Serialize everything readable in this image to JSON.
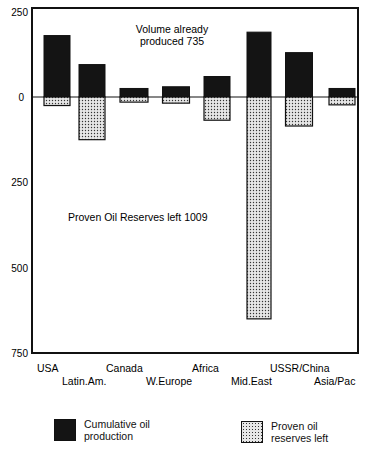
{
  "chart_data": {
    "type": "bar",
    "title": "",
    "xlabel": "",
    "ylabel": "",
    "ylim": [
      -750,
      250
    ],
    "yticks": [
      250,
      0,
      -250,
      -500,
      -750
    ],
    "ytick_labels": [
      "250",
      "0",
      "250",
      "500",
      "750"
    ],
    "categories": [
      "USA",
      "Latin.Am.",
      "Canada",
      "W.Europe",
      "Africa",
      "Mid.East",
      "USSR/China",
      "Asia/Pac"
    ],
    "series": [
      {
        "name": "Cumulative oil production",
        "direction": "up",
        "color": "#141414",
        "values": [
          180,
          95,
          25,
          30,
          60,
          190,
          130,
          25
        ]
      },
      {
        "name": "Proven oil reserves left",
        "direction": "down",
        "color": "#e0e0e0",
        "pattern": "dotted",
        "values": [
          25,
          125,
          15,
          18,
          68,
          650,
          85,
          23
        ]
      }
    ],
    "annotations": [
      {
        "text": "Volume already produced 735",
        "lines": [
          "Volume already",
          "produced 735"
        ]
      },
      {
        "text": "Proven Oil Reserves left 1009"
      }
    ],
    "grid": false,
    "legend_position": "bottom"
  },
  "legend": {
    "production": "Cumulative oil production",
    "production_lines": [
      "Cumulative oil",
      "production"
    ],
    "reserves": "Proven oil reserves left",
    "reserves_lines": [
      "Proven oil",
      "reserves left"
    ]
  }
}
